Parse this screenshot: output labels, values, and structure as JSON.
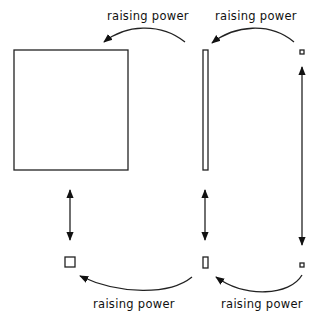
{
  "labels": {
    "top_left": "raising power",
    "top_right": "raising power",
    "bottom_left": "raising power",
    "bottom_right": "raising power"
  }
}
